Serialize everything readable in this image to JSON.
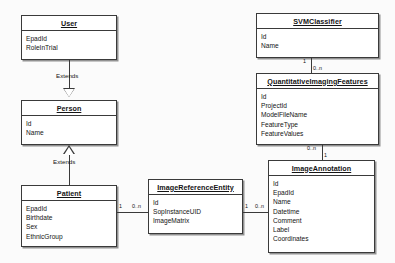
{
  "diagram": {
    "type": "uml-class-diagram",
    "background_color": "#fbfbfb",
    "line_color": "#3a3a3a",
    "box_fill": "#ffffff"
  },
  "classes": [
    {
      "id": "user",
      "name": "User",
      "attributes": [
        "EpadId",
        "RoleInTrial"
      ]
    },
    {
      "id": "person",
      "name": "Person",
      "attributes": [
        "Id",
        "Name"
      ]
    },
    {
      "id": "patient",
      "name": "Patient",
      "attributes": [
        "EpadId",
        "Birthdate",
        "Sex",
        "EthnicGroup"
      ]
    },
    {
      "id": "image_reference_entity",
      "name": "ImageReferenceEntity",
      "attributes": [
        "Id",
        "SopInstanceUID",
        "ImageMatrix"
      ]
    },
    {
      "id": "svm_classifier",
      "name": "SVMClassifier",
      "attributes": [
        "Id",
        "Name"
      ]
    },
    {
      "id": "quantitative_imaging_features",
      "name": "QuantitativeImagingFeatures",
      "attributes": [
        "Id",
        "ProjectId",
        "ModelFileName",
        "FeatureType",
        "FeatureValues"
      ]
    },
    {
      "id": "image_annotation",
      "name": "ImageAnnotation",
      "attributes": [
        "Id",
        "EpadId",
        "Name",
        "Datetime",
        "Comment",
        "Label",
        "Coordinates"
      ]
    }
  ],
  "relationships": [
    {
      "id": "user_extends_person",
      "from": "User",
      "to": "Person",
      "label": "Extends",
      "kind": "generalization"
    },
    {
      "id": "patient_extends_person",
      "from": "Patient",
      "to": "Person",
      "label": "Extends",
      "kind": "generalization"
    },
    {
      "id": "patient_to_imagereferenceentity",
      "from": "Patient",
      "to": "ImageReferenceEntity",
      "kind": "association",
      "source_multiplicity": "1",
      "target_multiplicity": "0..n"
    },
    {
      "id": "imagereferenceentity_to_imageannotation",
      "from": "ImageReferenceEntity",
      "to": "ImageAnnotation",
      "kind": "association",
      "source_multiplicity": "1",
      "target_multiplicity": "0..n"
    },
    {
      "id": "svmclassifier_to_quantitativeimagingfeatures",
      "from": "SVMClassifier",
      "to": "QuantitativeImagingFeatures",
      "kind": "association",
      "source_multiplicity": "1",
      "target_multiplicity": "0..n"
    },
    {
      "id": "quantitativeimagingfeatures_to_imageannotation",
      "from": "QuantitativeImagingFeatures",
      "to": "ImageAnnotation",
      "kind": "association",
      "source_multiplicity": "0..n",
      "target_multiplicity": "1"
    }
  ]
}
